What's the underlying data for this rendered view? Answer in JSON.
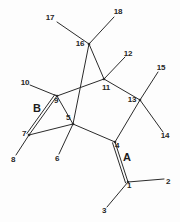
{
  "diagram": {
    "type": "chemical-structure-skeleton",
    "colors": {
      "background": "#fdfdfd",
      "bond": "#2b2b2b",
      "label": "#262626",
      "ring_label": "#1c1c1c"
    },
    "ring_labels": [
      {
        "id": "ring-a",
        "text": "A",
        "x": 127,
        "y": 157
      },
      {
        "id": "ring-b",
        "text": "B",
        "x": 37,
        "y": 108
      }
    ],
    "atom_labels": [
      {
        "id": "atom-1",
        "text": "1",
        "x": 129,
        "y": 186
      },
      {
        "id": "atom-2",
        "text": "2",
        "x": 168,
        "y": 182
      },
      {
        "id": "atom-3",
        "text": "3",
        "x": 104,
        "y": 211
      },
      {
        "id": "atom-4",
        "text": "4",
        "x": 117,
        "y": 146
      },
      {
        "id": "atom-5",
        "text": "5",
        "x": 68,
        "y": 118
      },
      {
        "id": "atom-6",
        "text": "6",
        "x": 57,
        "y": 159
      },
      {
        "id": "atom-7",
        "text": "7",
        "x": 24,
        "y": 134
      },
      {
        "id": "atom-8",
        "text": "8",
        "x": 13,
        "y": 160
      },
      {
        "id": "atom-9",
        "text": "9",
        "x": 56,
        "y": 101
      },
      {
        "id": "atom-10",
        "text": "10",
        "x": 25,
        "y": 83
      },
      {
        "id": "atom-11",
        "text": "11",
        "x": 106,
        "y": 88
      },
      {
        "id": "atom-12",
        "text": "12",
        "x": 128,
        "y": 54
      },
      {
        "id": "atom-13",
        "text": "13",
        "x": 132,
        "y": 100
      },
      {
        "id": "atom-14",
        "text": "14",
        "x": 165,
        "y": 136
      },
      {
        "id": "atom-15",
        "text": "15",
        "x": 161,
        "y": 68
      },
      {
        "id": "atom-16",
        "text": "16",
        "x": 80,
        "y": 44
      },
      {
        "id": "atom-17",
        "text": "17",
        "x": 50,
        "y": 18
      },
      {
        "id": "atom-18",
        "text": "18",
        "x": 118,
        "y": 12
      }
    ],
    "vertices": [
      {
        "id": "v1",
        "number": "1",
        "x": 128,
        "y": 182
      },
      {
        "id": "v4",
        "number": "4",
        "x": 115,
        "y": 142
      },
      {
        "id": "v5",
        "number": "5",
        "x": 73,
        "y": 124
      },
      {
        "id": "v7",
        "number": "7",
        "x": 29,
        "y": 135
      },
      {
        "id": "v9",
        "number": "9",
        "x": 57,
        "y": 96
      },
      {
        "id": "v11",
        "number": "11",
        "x": 104,
        "y": 79
      },
      {
        "id": "v13",
        "number": "13",
        "x": 140,
        "y": 100
      },
      {
        "id": "v16",
        "number": "16",
        "x": 89,
        "y": 44
      }
    ],
    "bonds": [
      {
        "id": "bond-16-17",
        "from": "16",
        "to": "17",
        "order": 1,
        "x1": 89,
        "y1": 44,
        "x2": 57,
        "y2": 22
      },
      {
        "id": "bond-16-18",
        "from": "16",
        "to": "18",
        "order": 1,
        "x1": 89,
        "y1": 44,
        "x2": 114,
        "y2": 17
      },
      {
        "id": "bond-16-11",
        "from": "16",
        "to": "11",
        "order": 1,
        "x1": 89,
        "y1": 44,
        "x2": 104,
        "y2": 79
      },
      {
        "id": "bond-16-5",
        "from": "16",
        "to": "5",
        "order": 1,
        "x1": 89,
        "y1": 44,
        "x2": 73,
        "y2": 124
      },
      {
        "id": "bond-11-12",
        "from": "11",
        "to": "12",
        "order": 1,
        "x1": 104,
        "y1": 79,
        "x2": 125,
        "y2": 57
      },
      {
        "id": "bond-11-9",
        "from": "11",
        "to": "9",
        "order": 1,
        "x1": 104,
        "y1": 79,
        "x2": 57,
        "y2": 96
      },
      {
        "id": "bond-11-13",
        "from": "11",
        "to": "13",
        "order": 1,
        "x1": 104,
        "y1": 79,
        "x2": 140,
        "y2": 100
      },
      {
        "id": "bond-9-10",
        "from": "9",
        "to": "10",
        "order": 1,
        "x1": 57,
        "y1": 96,
        "x2": 30,
        "y2": 85
      },
      {
        "id": "bond-9-7",
        "from": "9",
        "to": "7",
        "order": 2,
        "x1": 57,
        "y1": 96,
        "x2": 29,
        "y2": 135
      },
      {
        "id": "bond-9-5",
        "from": "9",
        "to": "5",
        "order": 1,
        "x1": 57,
        "y1": 96,
        "x2": 73,
        "y2": 124
      },
      {
        "id": "bond-7-8",
        "from": "7",
        "to": "8",
        "order": 1,
        "x1": 29,
        "y1": 135,
        "x2": 16,
        "y2": 155
      },
      {
        "id": "bond-7-5",
        "from": "7",
        "to": "5",
        "order": 1,
        "x1": 29,
        "y1": 135,
        "x2": 73,
        "y2": 124
      },
      {
        "id": "bond-5-6",
        "from": "5",
        "to": "6",
        "order": 1,
        "x1": 73,
        "y1": 124,
        "x2": 59,
        "y2": 154
      },
      {
        "id": "bond-5-4",
        "from": "5",
        "to": "4",
        "order": 1,
        "x1": 73,
        "y1": 124,
        "x2": 115,
        "y2": 142
      },
      {
        "id": "bond-13-15",
        "from": "13",
        "to": "15",
        "order": 1,
        "x1": 140,
        "y1": 100,
        "x2": 158,
        "y2": 72
      },
      {
        "id": "bond-13-14",
        "from": "13",
        "to": "14",
        "order": 1,
        "x1": 140,
        "y1": 100,
        "x2": 163,
        "y2": 132
      },
      {
        "id": "bond-13-4",
        "from": "13",
        "to": "4",
        "order": 1,
        "x1": 140,
        "y1": 100,
        "x2": 115,
        "y2": 142
      },
      {
        "id": "bond-4-1",
        "from": "4",
        "to": "1",
        "order": 2,
        "x1": 115,
        "y1": 142,
        "x2": 128,
        "y2": 182
      },
      {
        "id": "bond-1-2",
        "from": "1",
        "to": "2",
        "order": 1,
        "x1": 128,
        "y1": 182,
        "x2": 164,
        "y2": 179
      },
      {
        "id": "bond-1-3",
        "from": "1",
        "to": "3",
        "order": 1,
        "x1": 128,
        "y1": 182,
        "x2": 107,
        "y2": 207
      }
    ]
  }
}
